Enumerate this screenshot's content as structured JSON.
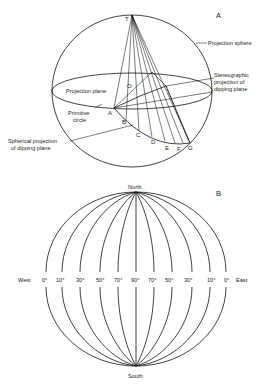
{
  "panel_a": {
    "label": "A",
    "apex": "T",
    "center": "O",
    "labels": {
      "projection_sphere": "Projection sphere",
      "projection_plane": "Projection plane",
      "stereo_line1": "Stereographic",
      "stereo_line2": "projection of",
      "stereo_line3": "dipping plane",
      "primitive_line1": "Primitive",
      "primitive_line2": "circle",
      "spherical_line1": "Spherical projection",
      "spherical_line2": "of dipping plane"
    },
    "points": [
      "A",
      "B",
      "C",
      "D",
      "E",
      "F",
      "G"
    ]
  },
  "panel_b": {
    "label": "B",
    "north": "North",
    "south": "South",
    "west": "West",
    "east": "East",
    "dip_labels": [
      "0°",
      "10°",
      "30°",
      "50°",
      "70°",
      "90°",
      "70°",
      "50°",
      "30°",
      "10°",
      "0°"
    ]
  }
}
